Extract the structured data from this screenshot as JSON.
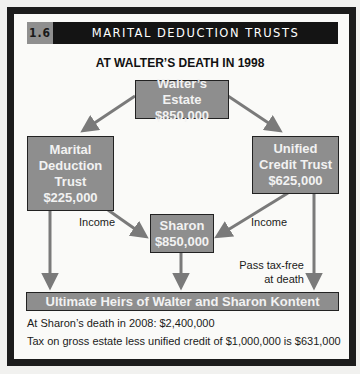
{
  "header": {
    "figure_number": "1.6",
    "title": "MARITAL DEDUCTION TRUSTS"
  },
  "subtitle": "AT WALTER’S DEATH IN 1998",
  "nodes": {
    "walter": {
      "line1": "Walter’s Estate",
      "line2": "$850,000"
    },
    "marital": {
      "line1": "Marital",
      "line2": "Deduction",
      "line3": "Trust",
      "line4": "$225,000"
    },
    "unified": {
      "line1": "Unified",
      "line2": "Credit Trust",
      "line3": "$625,000"
    },
    "sharon": {
      "line1": "Sharon",
      "line2": "$850,000"
    },
    "heirs": {
      "label": "Ultimate Heirs of Walter and Sharon Kontent"
    }
  },
  "edge_labels": {
    "income_left": "Income",
    "income_right": "Income",
    "pass_tax_free_1": "Pass tax-free",
    "pass_tax_free_2": "at death"
  },
  "notes": {
    "line1": "At Sharon’s death in 2008: $2,400,000",
    "line2": "Tax on gross estate less unified credit of $1,000,000 is $631,000"
  },
  "colors": {
    "box_fill": "#8e8e8e",
    "arrow": "#7a7a7a",
    "frame": "#1c1c1c",
    "header_bar": "#141414"
  }
}
